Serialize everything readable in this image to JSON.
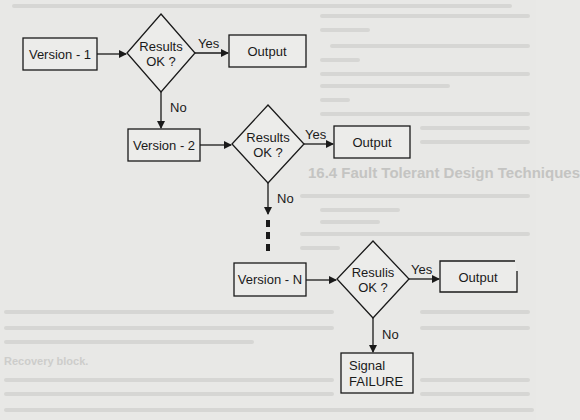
{
  "colors": {
    "paper": "#e8e8e6",
    "ink": "#1a1a1a",
    "show_through": "#d2d2d0"
  },
  "flowchart": {
    "nodes": {
      "version_1": {
        "label": "Version - 1"
      },
      "decision_1": {
        "line1": "Results",
        "line2": "OK ?"
      },
      "output_1": {
        "label": "Output"
      },
      "version_2": {
        "label": "Version - 2"
      },
      "decision_2": {
        "line1": "Results",
        "line2": "OK ?"
      },
      "output_2": {
        "label": "Output"
      },
      "version_n": {
        "label": "Version - N"
      },
      "decision_n": {
        "line1": "Resulis",
        "line2": "OK ?"
      },
      "output_n": {
        "label": "Output"
      },
      "failure": {
        "line1": "Signal",
        "line2": "FAILURE"
      }
    },
    "edge_labels": {
      "yes_1": "Yes",
      "no_1": "No",
      "yes_2": "Yes",
      "no_2": "No",
      "yes_n": "Yes",
      "no_n": "No"
    }
  },
  "show_through": {
    "heading": "16.4  Fault Tolerant Design Techniques",
    "subheading": "Recovery block."
  }
}
